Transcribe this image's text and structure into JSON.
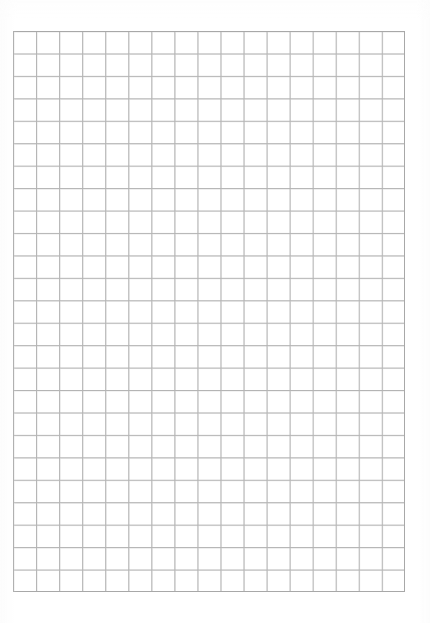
{
  "document": {
    "kind": "scanned-grid-paper",
    "title": "Blank graph paper sheet",
    "page_width": 430,
    "page_height": 623,
    "background_color": "#fefefe",
    "paper_color": "#ffffff",
    "text_content": ""
  },
  "grid": {
    "label": "graph-paper-grid",
    "columns": 17,
    "rows": 25,
    "cell_width": 23.06,
    "cell_height": 22.44,
    "left": 13,
    "top": 31,
    "width": 392,
    "height": 561,
    "line_color": "#b4b4b4",
    "border_color": "#a8a8a8",
    "line_width": 1,
    "border_width": 1
  },
  "margins": {
    "left": 13,
    "right": 25,
    "top": 31,
    "bottom": 31,
    "color": "#ffffff"
  }
}
